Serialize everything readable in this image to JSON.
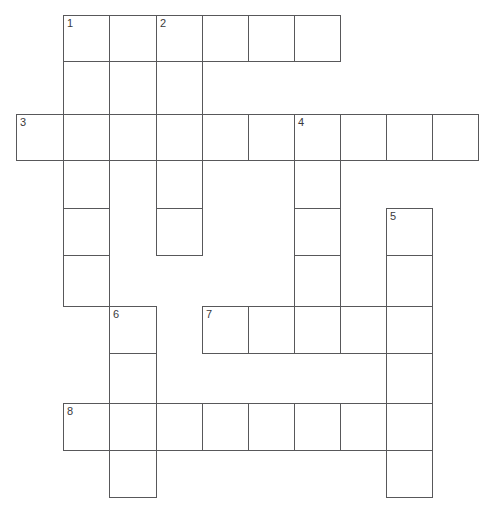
{
  "puzzle": {
    "kind": "crossword-grid",
    "title": "",
    "canvas": {
      "width": 492,
      "height": 522
    },
    "background_color": "#ffffff",
    "cell_border_color": "#58585a",
    "cell_fill_color": "#ffffff",
    "number_color": "#3a3a3c",
    "columns": 10,
    "rows": 10,
    "column_x": [
      16,
      63,
      109,
      156,
      202,
      248,
      294,
      340,
      386,
      432,
      478
    ],
    "row_y": [
      15,
      61,
      114,
      160,
      208,
      255,
      306,
      353,
      403,
      450,
      497
    ],
    "clue_numbers": [
      "1",
      "2",
      "3",
      "4",
      "5",
      "6",
      "7",
      "8"
    ],
    "cells": [
      {
        "col": 1,
        "row": 0,
        "number": "1",
        "letter": ""
      },
      {
        "col": 2,
        "row": 0,
        "number": "",
        "letter": ""
      },
      {
        "col": 3,
        "row": 0,
        "number": "2",
        "letter": ""
      },
      {
        "col": 4,
        "row": 0,
        "number": "",
        "letter": ""
      },
      {
        "col": 5,
        "row": 0,
        "number": "",
        "letter": ""
      },
      {
        "col": 6,
        "row": 0,
        "number": "",
        "letter": ""
      },
      {
        "col": 1,
        "row": 1,
        "number": "",
        "letter": ""
      },
      {
        "col": 2,
        "row": 1,
        "number": "",
        "letter": ""
      },
      {
        "col": 3,
        "row": 1,
        "number": "",
        "letter": ""
      },
      {
        "col": 0,
        "row": 2,
        "number": "3",
        "letter": ""
      },
      {
        "col": 1,
        "row": 2,
        "number": "",
        "letter": ""
      },
      {
        "col": 2,
        "row": 2,
        "number": "",
        "letter": ""
      },
      {
        "col": 3,
        "row": 2,
        "number": "",
        "letter": ""
      },
      {
        "col": 4,
        "row": 2,
        "number": "",
        "letter": ""
      },
      {
        "col": 5,
        "row": 2,
        "number": "",
        "letter": ""
      },
      {
        "col": 6,
        "row": 2,
        "number": "4",
        "letter": ""
      },
      {
        "col": 7,
        "row": 2,
        "number": "",
        "letter": ""
      },
      {
        "col": 8,
        "row": 2,
        "number": "",
        "letter": ""
      },
      {
        "col": 9,
        "row": 2,
        "number": "",
        "letter": ""
      },
      {
        "col": 1,
        "row": 3,
        "number": "",
        "letter": ""
      },
      {
        "col": 3,
        "row": 3,
        "number": "",
        "letter": ""
      },
      {
        "col": 6,
        "row": 3,
        "number": "",
        "letter": ""
      },
      {
        "col": 1,
        "row": 4,
        "number": "",
        "letter": ""
      },
      {
        "col": 3,
        "row": 4,
        "number": "",
        "letter": ""
      },
      {
        "col": 6,
        "row": 4,
        "number": "",
        "letter": ""
      },
      {
        "col": 8,
        "row": 4,
        "number": "5",
        "letter": ""
      },
      {
        "col": 1,
        "row": 5,
        "number": "",
        "letter": ""
      },
      {
        "col": 6,
        "row": 5,
        "number": "",
        "letter": ""
      },
      {
        "col": 8,
        "row": 5,
        "number": "",
        "letter": ""
      },
      {
        "col": 2,
        "row": 6,
        "number": "6",
        "letter": ""
      },
      {
        "col": 4,
        "row": 6,
        "number": "7",
        "letter": ""
      },
      {
        "col": 5,
        "row": 6,
        "number": "",
        "letter": ""
      },
      {
        "col": 6,
        "row": 6,
        "number": "",
        "letter": ""
      },
      {
        "col": 7,
        "row": 6,
        "number": "",
        "letter": ""
      },
      {
        "col": 8,
        "row": 6,
        "number": "",
        "letter": ""
      },
      {
        "col": 2,
        "row": 7,
        "number": "",
        "letter": ""
      },
      {
        "col": 8,
        "row": 7,
        "number": "",
        "letter": ""
      },
      {
        "col": 1,
        "row": 8,
        "number": "8",
        "letter": ""
      },
      {
        "col": 2,
        "row": 8,
        "number": "",
        "letter": ""
      },
      {
        "col": 3,
        "row": 8,
        "number": "",
        "letter": ""
      },
      {
        "col": 4,
        "row": 8,
        "number": "",
        "letter": ""
      },
      {
        "col": 5,
        "row": 8,
        "number": "",
        "letter": ""
      },
      {
        "col": 6,
        "row": 8,
        "number": "",
        "letter": ""
      },
      {
        "col": 7,
        "row": 8,
        "number": "",
        "letter": ""
      },
      {
        "col": 8,
        "row": 8,
        "number": "",
        "letter": ""
      },
      {
        "col": 2,
        "row": 9,
        "number": "",
        "letter": ""
      },
      {
        "col": 8,
        "row": 9,
        "number": "",
        "letter": ""
      }
    ]
  }
}
